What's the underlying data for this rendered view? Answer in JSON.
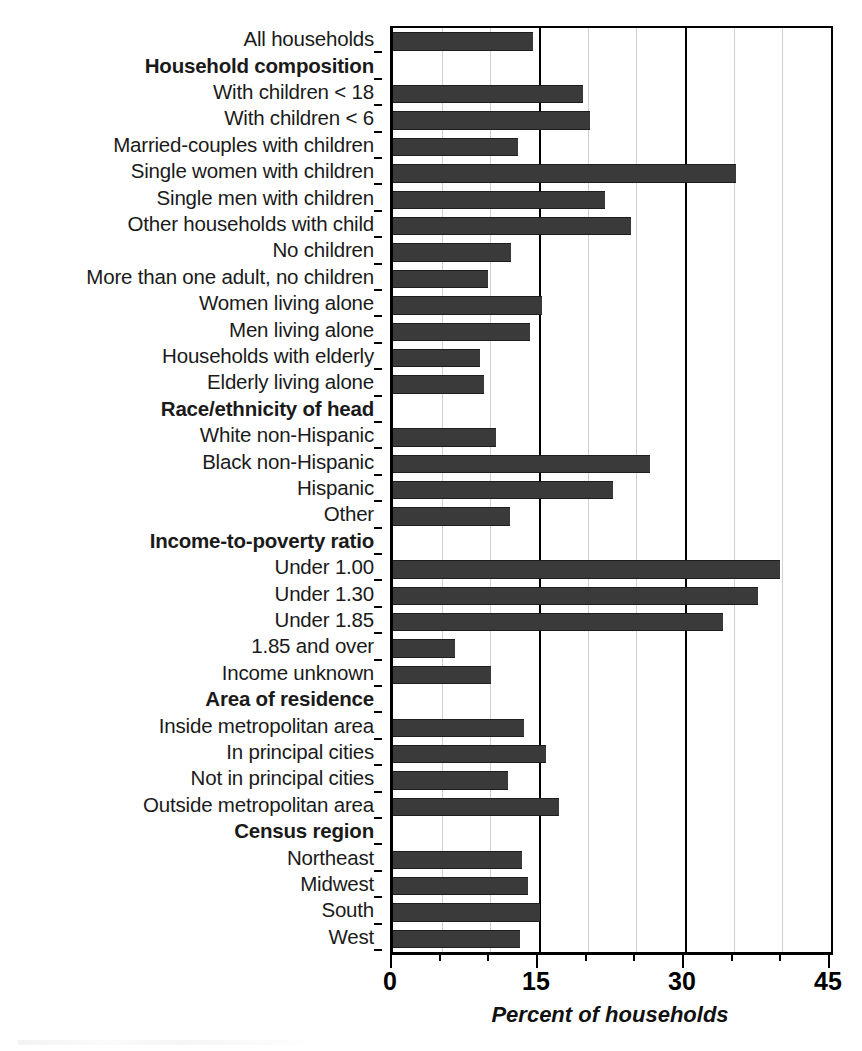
{
  "chart_data": {
    "type": "bar",
    "orientation": "horizontal",
    "title": "",
    "xlabel": "Percent of households",
    "ylabel": "",
    "xlim": [
      0,
      45
    ],
    "xticks": [
      0,
      15,
      30,
      45
    ],
    "xtick_labels": [
      "0",
      "15",
      "30",
      "45"
    ],
    "minor_xticks": [
      5,
      10,
      20,
      25,
      35,
      40
    ],
    "grid": "vertical gridlines: dark at 15 and 30, light at 5/10/20/25/35/40",
    "legend": "none",
    "bar_color": "#3a3a3a",
    "categories": [
      "All households",
      "Household composition",
      "With children < 18",
      "With children < 6",
      "Married-couples with children",
      "Single women with children",
      "Single men with children",
      "Other households with child",
      "No children",
      "More than one adult, no children",
      "Women living alone",
      "Men living alone",
      "Households with elderly",
      "Elderly living alone",
      "Race/ethnicity of head",
      "White non-Hispanic",
      "Black non-Hispanic",
      "Hispanic",
      "Other",
      "Income-to-poverty ratio",
      "Under 1.00",
      "Under 1.30",
      "Under 1.85",
      "1.85 and over",
      "Income unknown",
      "Area of residence",
      "Inside metropolitan area",
      "In principal cities",
      "Not in principal cities",
      "Outside metropolitan area",
      "Census region",
      "Northeast",
      "Midwest",
      "South",
      "West"
    ],
    "values": [
      14.4,
      null,
      19.5,
      20.2,
      12.8,
      35.2,
      21.8,
      24.5,
      12.1,
      9.8,
      15.3,
      14.1,
      8.9,
      9.4,
      null,
      10.6,
      26.4,
      22.6,
      12.0,
      null,
      39.8,
      37.5,
      33.9,
      6.4,
      10.1,
      null,
      13.5,
      15.7,
      11.8,
      17.1,
      null,
      13.3,
      13.9,
      15.1,
      13.0
    ],
    "group_headers": [
      "Household composition",
      "Race/ethnicity of head",
      "Income-to-poverty ratio",
      "Area of residence",
      "Census region"
    ]
  }
}
